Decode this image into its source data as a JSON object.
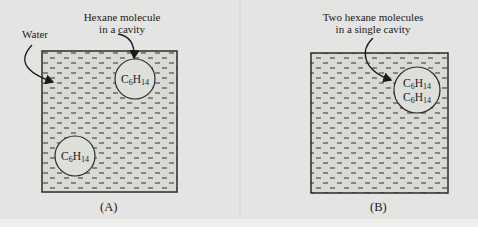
{
  "panels": [
    {
      "id": "A",
      "caption": "(A)",
      "labels": {
        "water": "Water",
        "cavity_line1": "Hexane molecule",
        "cavity_line2": "in a cavity"
      },
      "molecules": [
        {
          "element1": "C",
          "sub1": "6",
          "element2": "H",
          "sub2": "14"
        },
        {
          "element1": "C",
          "sub1": "6",
          "element2": "H",
          "sub2": "14"
        }
      ]
    },
    {
      "id": "B",
      "caption": "(B)",
      "labels": {
        "cavity_line1": "Two hexane molecules",
        "cavity_line2": "in a single cavity"
      },
      "molecules": [
        {
          "element1": "C",
          "sub1": "6",
          "element2": "H",
          "sub2": "14"
        },
        {
          "element1": "C",
          "sub1": "6",
          "element2": "H",
          "sub2": "14"
        }
      ]
    }
  ],
  "colors": {
    "background": "#e4e4e2",
    "box_fill": "#d9d9d6",
    "stroke": "#2a2a2a",
    "dash": "#4a4a4a"
  }
}
